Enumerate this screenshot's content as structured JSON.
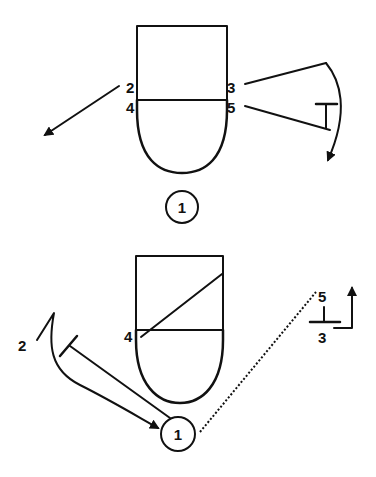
{
  "diagrams": [
    {
      "name": "play-diagram-top",
      "players": [
        {
          "label": "2",
          "x": 126,
          "y": 93
        },
        {
          "label": "3",
          "x": 229,
          "y": 93
        },
        {
          "label": "4",
          "x": 126,
          "y": 113
        },
        {
          "label": "5",
          "x": 229,
          "y": 113
        },
        {
          "label": "1",
          "x": 182,
          "y": 207,
          "circled": true
        }
      ]
    },
    {
      "name": "play-diagram-bottom",
      "players": [
        {
          "label": "2",
          "x": 18,
          "y": 351
        },
        {
          "label": "4",
          "x": 124,
          "y": 342
        },
        {
          "label": "5",
          "x": 316,
          "y": 302
        },
        {
          "label": "3",
          "x": 316,
          "y": 343
        },
        {
          "label": "1",
          "x": 178,
          "y": 434,
          "circled": true
        }
      ]
    }
  ],
  "colors": {
    "ink": "#111111",
    "background": "#ffffff"
  }
}
